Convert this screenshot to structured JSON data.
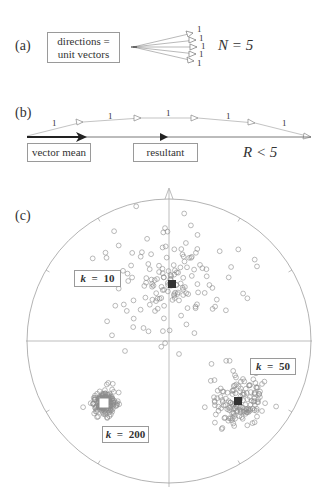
{
  "panel_a": {
    "label": "(a)",
    "box_line1": "directions =",
    "box_line2": "unit vectors",
    "unit_labels": [
      "1",
      "1",
      "1",
      "1",
      "1"
    ],
    "n_text": "N = 5"
  },
  "panel_b": {
    "label": "(b)",
    "unit_labels": [
      "1",
      "1",
      "1",
      "1",
      "1"
    ],
    "vector_mean_label": "vector mean",
    "resultant_label": "resultant",
    "r_text": "R < 5"
  },
  "panel_c": {
    "label": "(c)",
    "clusters": [
      {
        "k_symbol": "k",
        "eq": "=",
        "k_value": "10",
        "mean_marker": "filled-square"
      },
      {
        "k_symbol": "k",
        "eq": "=",
        "k_value": "50",
        "mean_marker": "filled-square"
      },
      {
        "k_symbol": "k",
        "eq": "=",
        "k_value": "200",
        "mean_marker": "open-square"
      }
    ]
  },
  "colors": {
    "line": "#8a8a8a",
    "dark": "#222222",
    "point": "#8c8c8c"
  }
}
